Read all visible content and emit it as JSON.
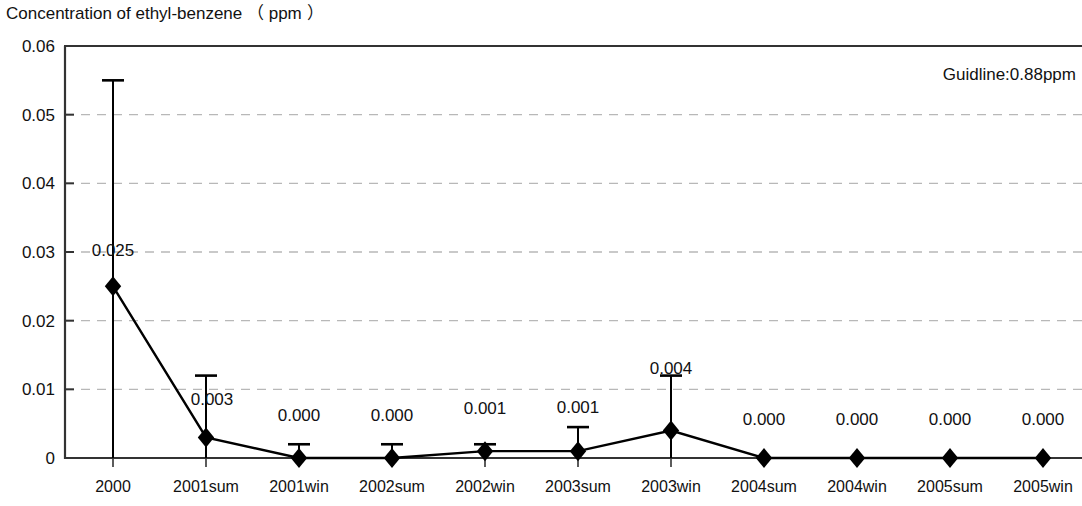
{
  "chart_data": {
    "type": "line",
    "title": "Concentration of ethyl-benzene （ ppm ）",
    "xlabel": "",
    "ylabel": "",
    "ylim": [
      0,
      0.06
    ],
    "yticks": [
      "0",
      "0.01",
      "0.02",
      "0.03",
      "0.04",
      "0.05",
      "0.06"
    ],
    "ytick_values": [
      0,
      0.01,
      0.02,
      0.03,
      0.04,
      0.05,
      0.06
    ],
    "grid": "horizontal-dashed",
    "legend": "none",
    "annotation": "Guidline:0.88ppm",
    "categories": [
      "2000",
      "2001sum",
      "2001win",
      "2002sum",
      "2002win",
      "2003sum",
      "2003win",
      "2004sum",
      "2004win",
      "2005sum",
      "2005win"
    ],
    "values": [
      0.025,
      0.003,
      0.0,
      0.0,
      0.001,
      0.001,
      0.004,
      0.0,
      0.0,
      0.0,
      0.0
    ],
    "point_labels": [
      "0.025",
      "0.003",
      "0.000",
      "0.000",
      "0.001",
      "0.001",
      "0.004",
      "0.000",
      "0.000",
      "0.000",
      "0.000"
    ],
    "error_high": [
      0.055,
      0.012,
      0.002,
      0.002,
      0.002,
      0.0045,
      0.012,
      0.0,
      0.0,
      0.0,
      0.0
    ],
    "error_low": [
      0.0,
      0.0,
      0.0,
      0.0,
      0.0,
      0.0,
      0.0,
      0.0,
      0.0,
      0.0,
      0.0
    ],
    "series": [
      {
        "name": "ethyl-benzene",
        "marker": "diamond",
        "color": "#000000",
        "values": [
          0.025,
          0.003,
          0.0,
          0.0,
          0.001,
          0.001,
          0.004,
          0.0,
          0.0,
          0.0,
          0.0
        ]
      }
    ],
    "colors": {
      "line": "#000000",
      "marker": "#000000",
      "grid": "#b8b8b8",
      "axis": "#333333",
      "text": "#111111"
    }
  }
}
